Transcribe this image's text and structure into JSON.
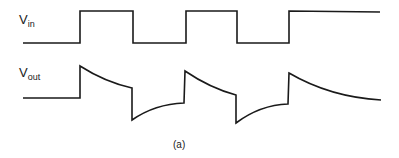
{
  "labels": {
    "vin_main": "V",
    "vin_sub": "in",
    "vout_main": "V",
    "vout_sub": "out",
    "caption": "(a)"
  },
  "colors": {
    "stroke": "#1a1a1a",
    "background": "#ffffff"
  },
  "waveforms": {
    "vin_path": "M23,43 L80,43 L80,11 L133,11 L133,43 L186,43 L186,11 L237,11 L237,43 L289,43 L289,11 L380,12",
    "vout_path": "M23,98 L80,98 L80,66 Q105,82 132,88 L132,120 Q155,104 184,103 L185,71 Q210,88 236,95 L236,123 Q260,105 288,104 L289,73 Q330,97 381,100"
  }
}
